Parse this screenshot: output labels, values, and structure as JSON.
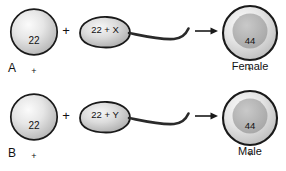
{
  "diagram": {
    "rows": [
      {
        "letter": "A",
        "egg": {
          "chromosomes": "22",
          "plus": "+",
          "sex_chromosome": "X"
        },
        "operator": "+",
        "sperm": {
          "label": "22 + X"
        },
        "zygote": {
          "chromosomes": "44",
          "plus": "+",
          "sex_chromosomes": "XX"
        },
        "outcome": "Female"
      },
      {
        "letter": "B",
        "egg": {
          "chromosomes": "22",
          "plus": "+",
          "sex_chromosome": "X"
        },
        "operator": "+",
        "sperm": {
          "label": "22 + Y"
        },
        "zygote": {
          "chromosomes": "44",
          "plus": "+",
          "sex_chromosomes": "XY"
        },
        "outcome": "Male"
      }
    ],
    "colors": {
      "outline": "#1a1a1a",
      "cell_light": "#f2f2f2",
      "cell_mid": "#d8d8d8",
      "cell_edge": "#a8a8a8",
      "nucleus": "#b5b5b5",
      "text": "#111111",
      "background": "#ffffff"
    },
    "icons": {
      "egg": "egg-cell-icon",
      "sperm": "sperm-cell-icon",
      "arrow": "arrow-right-icon",
      "zygote": "zygote-cell-icon"
    }
  }
}
